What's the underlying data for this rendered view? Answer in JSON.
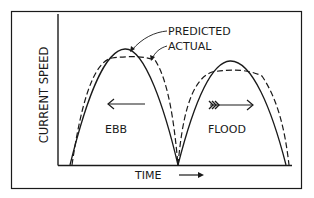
{
  "diagram": {
    "type": "tidal-current-curve",
    "y_axis_label": "CURRENT SPEED",
    "x_axis_label": "TIME",
    "legend": {
      "predicted": "PREDICTED",
      "actual": "ACTUAL"
    },
    "phases": [
      {
        "label": "EBB",
        "arrow_direction": "left"
      },
      {
        "label": "FLOOD",
        "arrow_direction": "right"
      }
    ],
    "line_styles": {
      "predicted": "solid",
      "actual": "dashed"
    },
    "colors": {
      "ink": "#1a1a1a",
      "background": "#ffffff"
    }
  }
}
